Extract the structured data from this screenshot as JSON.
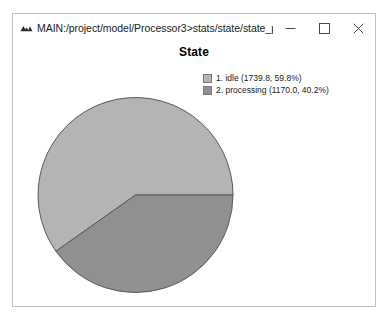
{
  "window": {
    "title": "MAIN:/project/model/Processor3>stats/state/state_profile As Gra...",
    "icon": "mountain-peaks-icon",
    "controls": {
      "minimize": "−",
      "maximize": "□",
      "close": "×"
    }
  },
  "chart_data": {
    "type": "pie",
    "title": "State",
    "xlabel": "",
    "ylabel": "",
    "legend_position": "top-right",
    "grid": false,
    "start_angle_deg": 0,
    "direction": "counterclockwise",
    "total": 2909.8,
    "categories": [
      "idle",
      "processing"
    ],
    "values": [
      1739.8,
      1170.0
    ],
    "percents": [
      59.8,
      40.2
    ],
    "colors": [
      "#b4b4b4",
      "#909090"
    ],
    "slices": [
      {
        "index": 1,
        "label": "idle",
        "value": 1739.8,
        "percent": 59.8,
        "color": "#b4b4b4",
        "legend_text": "1. idle (1739.8, 59.8%)"
      },
      {
        "index": 2,
        "label": "processing",
        "value": 1170.0,
        "percent": 40.2,
        "color": "#909090",
        "legend_text": "2. processing (1170.0, 40.2%)"
      }
    ]
  },
  "legend": {
    "entries": [
      {
        "text": "1. idle (1739.8, 59.8%)",
        "color": "#b4b4b4"
      },
      {
        "text": "2. processing (1170.0, 40.2%)",
        "color": "#909090"
      }
    ]
  },
  "colors": {
    "slice_idle": "#b4b4b4",
    "slice_processing": "#909090",
    "outline": "#5a5a5a",
    "window_border": "#c2c2c2",
    "background": "#ffffff",
    "text": "#1b1b1b"
  }
}
